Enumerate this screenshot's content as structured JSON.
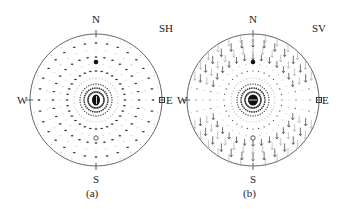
{
  "figure": {
    "panels": [
      {
        "id": "a",
        "type_label": "SH",
        "caption": "(a)",
        "compass": {
          "north": "N",
          "south": "S",
          "west": "W",
          "east": "E"
        },
        "center": [
          96,
          100
        ],
        "radius": 66,
        "arrow_style": "horizontal-ticks"
      },
      {
        "id": "b",
        "type_label": "SV",
        "caption": "(b)",
        "compass": {
          "north": "N",
          "south": "S",
          "west": "W",
          "east": "E"
        },
        "center": [
          253,
          100
        ],
        "radius": 66,
        "arrow_style": "radial-arrows"
      }
    ],
    "colors": {
      "outline": "#555555",
      "marks": "#333333",
      "faint": "#aaaaaa",
      "background": "#ffffff"
    }
  }
}
